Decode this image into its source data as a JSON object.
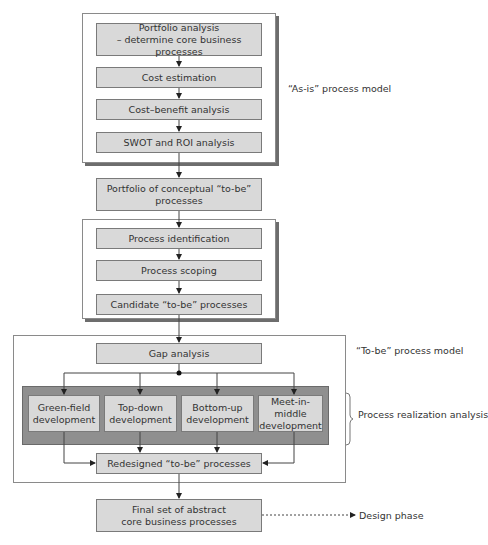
{
  "as_is": {
    "label": "“As-is” process model",
    "steps": [
      "Portfolio analysis\n– determine core business processes",
      "Cost estimation",
      "Cost–benefit analysis",
      "SWOT and ROI analysis"
    ]
  },
  "portfolio": "Portfolio of conceptual “to-be”\nprocesses",
  "identification": {
    "steps": [
      "Process identification",
      "Process scoping",
      "Candidate “to-be” processes"
    ]
  },
  "to_be": {
    "label": "“To-be” process model",
    "gap": "Gap analysis",
    "realization_label": "Process realization analysis",
    "approaches": [
      "Green-field\ndevelopment",
      "Top-down\ndevelopment",
      "Bottom-up\ndevelopment",
      "Meet-in-middle\ndevelopment"
    ],
    "redesigned": "Redesigned “to-be” processes"
  },
  "final": "Final set of abstract\ncore business processes",
  "design_phase": "Design phase",
  "colors": {
    "box_fill": "#d9d9d9",
    "panel_fill": "#8f8f8f",
    "border": "#7a7a7a"
  }
}
